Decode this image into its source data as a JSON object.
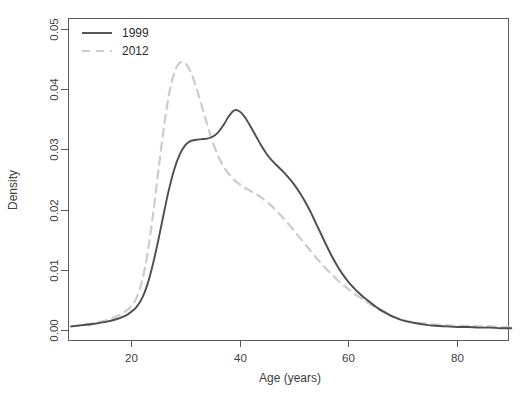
{
  "chart_data": {
    "type": "line",
    "title": "",
    "subtitle": "",
    "xlabel": "Age (years)",
    "ylabel": "Density",
    "xlim": [
      9,
      90
    ],
    "ylim": [
      0,
      0.05
    ],
    "xticks": [
      20,
      40,
      60,
      80
    ],
    "xtick_labels": [
      "20",
      "40",
      "60",
      "80"
    ],
    "yticks": [
      0.0,
      0.01,
      0.02,
      0.03,
      0.04,
      0.05
    ],
    "ytick_labels": [
      "0.00",
      "0.01",
      "0.02",
      "0.03",
      "0.04",
      "0.05"
    ],
    "grid": false,
    "legend_position": "top-left",
    "x": [
      9,
      11,
      13,
      15,
      17,
      19,
      20,
      21,
      22,
      23,
      24,
      25,
      26,
      27,
      28,
      29,
      30,
      31,
      32,
      33,
      34,
      35,
      36,
      37,
      38,
      39,
      40,
      41,
      42,
      43,
      44,
      45,
      46,
      47,
      48,
      49,
      50,
      51,
      52,
      53,
      54,
      55,
      56,
      57,
      58,
      59,
      60,
      61,
      62,
      63,
      64,
      65,
      66,
      67,
      68,
      70,
      72,
      74,
      76,
      78,
      80,
      82,
      84,
      86,
      88,
      90
    ],
    "series": [
      {
        "name": "1999",
        "color": "#4d4d4d",
        "linestyle": "solid",
        "linewidth": 1.9,
        "values": [
          0.0006,
          0.0008,
          0.001,
          0.0013,
          0.0017,
          0.0024,
          0.003,
          0.0038,
          0.0052,
          0.0075,
          0.0108,
          0.0148,
          0.0192,
          0.0234,
          0.0268,
          0.0292,
          0.0307,
          0.0314,
          0.0316,
          0.0317,
          0.0318,
          0.0321,
          0.0328,
          0.034,
          0.0355,
          0.0365,
          0.0363,
          0.0353,
          0.0338,
          0.0322,
          0.0306,
          0.0292,
          0.0281,
          0.0272,
          0.0263,
          0.0253,
          0.0242,
          0.0229,
          0.0214,
          0.0197,
          0.0178,
          0.0159,
          0.014,
          0.0122,
          0.0106,
          0.0092,
          0.008,
          0.007,
          0.0061,
          0.0053,
          0.0046,
          0.0039,
          0.0033,
          0.0028,
          0.0023,
          0.0016,
          0.0012,
          0.0009,
          0.0007,
          0.0006,
          0.0005,
          0.0005,
          0.0004,
          0.0004,
          0.0003,
          0.0003
        ]
      },
      {
        "name": "2012",
        "color": "#cccccc",
        "linestyle": "dashed",
        "linewidth": 2.2,
        "values": [
          0.0006,
          0.0008,
          0.0011,
          0.0015,
          0.0021,
          0.0031,
          0.0039,
          0.0053,
          0.008,
          0.0125,
          0.0188,
          0.0262,
          0.0333,
          0.0392,
          0.0428,
          0.0444,
          0.0443,
          0.0428,
          0.0403,
          0.0373,
          0.0342,
          0.0313,
          0.029,
          0.0272,
          0.0259,
          0.0249,
          0.0242,
          0.0236,
          0.0231,
          0.0226,
          0.022,
          0.0213,
          0.0205,
          0.0196,
          0.0186,
          0.0176,
          0.0165,
          0.0154,
          0.0143,
          0.0132,
          0.0121,
          0.0111,
          0.0101,
          0.0092,
          0.0083,
          0.0075,
          0.0068,
          0.0061,
          0.0055,
          0.0049,
          0.0043,
          0.0037,
          0.0032,
          0.0027,
          0.0023,
          0.0017,
          0.0013,
          0.0011,
          0.0009,
          0.0008,
          0.0007,
          0.0007,
          0.0006,
          0.0006,
          0.0005,
          0.0005
        ]
      }
    ]
  },
  "legend": {
    "entries": [
      {
        "label": "1999"
      },
      {
        "label": "2012"
      }
    ]
  }
}
